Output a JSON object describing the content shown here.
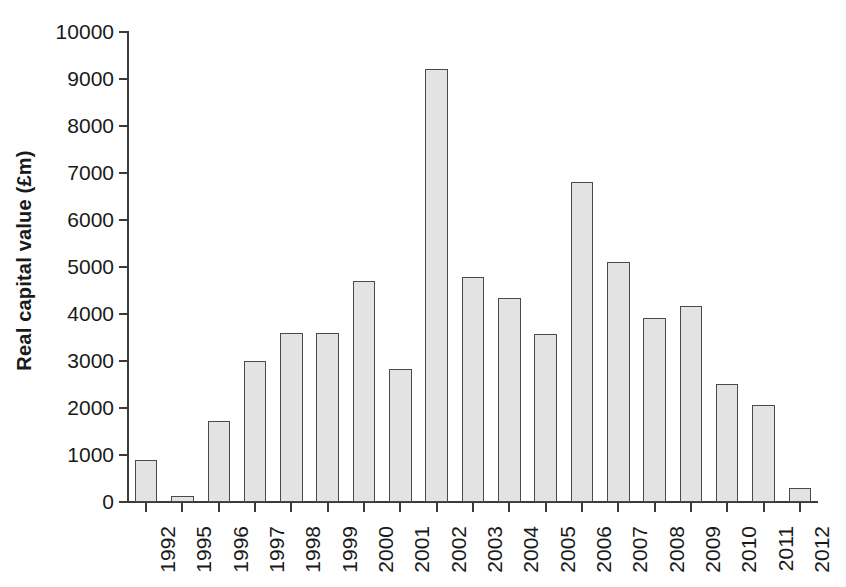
{
  "chart_data": {
    "type": "bar",
    "title": "",
    "xlabel": "",
    "ylabel": "Real capital value (£m)",
    "ylim": [
      0,
      10000
    ],
    "ytick_labels": [
      "10000",
      "9000",
      "8000",
      "7000",
      "6000",
      "5000",
      "4000",
      "3000",
      "2000",
      "1000",
      "0"
    ],
    "ytick_values": [
      10000,
      9000,
      8000,
      7000,
      6000,
      5000,
      4000,
      3000,
      2000,
      1000,
      0
    ],
    "grid": false,
    "legend": "none",
    "categories": [
      "1992",
      "1995",
      "1996",
      "1997",
      "1998",
      "1999",
      "2000",
      "2001",
      "2002",
      "2003",
      "2004",
      "2005",
      "2006",
      "2007",
      "2008",
      "2009",
      "2010",
      "2011",
      "2012"
    ],
    "values": [
      900,
      130,
      1720,
      2990,
      3600,
      3600,
      4700,
      2840,
      9220,
      4790,
      4340,
      3570,
      6800,
      5110,
      3920,
      4160,
      2520,
      2070,
      300
    ],
    "bar_fill_color": "#e3e3e3",
    "bar_edge_color": "#4a4a4a",
    "axis_color": "#3a3a3a"
  }
}
